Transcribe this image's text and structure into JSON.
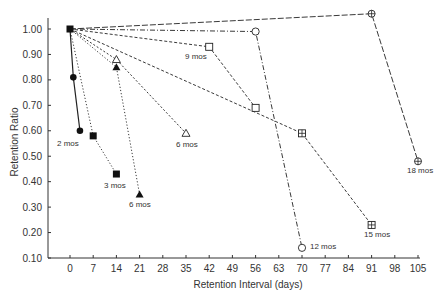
{
  "chart_data": {
    "type": "line",
    "title": "",
    "xlabel": "Retention Interval (days)",
    "ylabel": "Retention Ratio",
    "xlim": [
      -10,
      105
    ],
    "ylim": [
      0.1,
      1.05
    ],
    "x_ticks": [
      0,
      7,
      14,
      21,
      28,
      35,
      42,
      49,
      56,
      63,
      70,
      77,
      84,
      91,
      98,
      105
    ],
    "y_ticks": [
      "0.10",
      "0.20",
      "0.30",
      "0.40",
      "0.50",
      "0.60",
      "0.70",
      "0.80",
      "0.90",
      "1.00"
    ],
    "grid": false,
    "legend": "inline point labels",
    "series": [
      {
        "name": "2 mos",
        "marker": "filled-circle",
        "line": "solid",
        "x": [
          0,
          1,
          3
        ],
        "y": [
          1.0,
          0.81,
          0.6
        ],
        "label_pos": [
          57,
          146
        ]
      },
      {
        "name": "3 mos",
        "marker": "filled-square",
        "line": "dotted",
        "x": [
          0,
          7,
          14
        ],
        "y": [
          1.0,
          0.58,
          0.43
        ],
        "label_pos": [
          104,
          188
        ]
      },
      {
        "name": "6 mos",
        "marker": "filled-triangle",
        "line": "dotted",
        "x": [
          0,
          14,
          21
        ],
        "y": [
          1.0,
          0.85,
          0.35
        ],
        "label_pos": [
          129,
          207
        ]
      },
      {
        "name": "6 mos",
        "marker": "open-triangle",
        "line": "short-dash",
        "x": [
          0,
          14,
          35
        ],
        "y": [
          1.0,
          0.88,
          0.59
        ],
        "label_pos": [
          176,
          147
        ]
      },
      {
        "name": "9 mos",
        "marker": "open-square",
        "line": "dashed",
        "x": [
          0,
          42,
          56
        ],
        "y": [
          1.0,
          0.93,
          0.69
        ],
        "label_pos": [
          185,
          59
        ]
      },
      {
        "name": "12 mos",
        "marker": "open-circle",
        "line": "dash-dot",
        "x": [
          0,
          56,
          70
        ],
        "y": [
          1.0,
          0.99,
          0.14
        ],
        "label_pos": [
          310,
          249
        ]
      },
      {
        "name": "15 mos",
        "marker": "squared-plus",
        "line": "dashed",
        "x": [
          0,
          70,
          91
        ],
        "y": [
          1.0,
          0.59,
          0.23
        ],
        "label_pos": [
          364,
          237
        ]
      },
      {
        "name": "18 mos",
        "marker": "circled-plus",
        "line": "long-dash",
        "x": [
          0,
          91,
          105
        ],
        "y": [
          1.0,
          1.06,
          0.48
        ],
        "label_pos": [
          407,
          173
        ]
      }
    ]
  }
}
